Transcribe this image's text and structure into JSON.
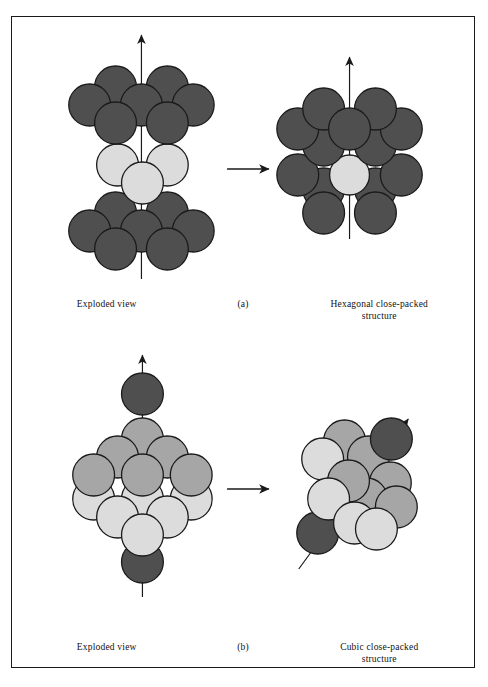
{
  "figure": {
    "background": "#ffffff",
    "border_color": "#1a1a1a"
  },
  "colors": {
    "dark_sphere": "#4f4f4f",
    "medium_sphere": "#a6a6a6",
    "light_sphere": "#dcdcdc",
    "outline": "#1a1a1a",
    "arrow": "#1a1a1a"
  },
  "panels": [
    {
      "id": "a",
      "label": "(a)",
      "left_caption": "Exploded view",
      "right_caption_line1": "Hexagonal close-packed",
      "right_caption_line2": "structure",
      "arrow_name": "transform-arrow-hcp",
      "axis_name": "c-axis-arrow",
      "exploded_layers": [
        {
          "name": "top-layer-A",
          "color_key": "dark_sphere",
          "count": 7,
          "pattern": "hexagonal"
        },
        {
          "name": "middle-layer-B",
          "color_key": "light_sphere",
          "count": 3,
          "pattern": "triangular"
        },
        {
          "name": "bottom-layer-A",
          "color_key": "dark_sphere",
          "count": 7,
          "pattern": "hexagonal"
        }
      ],
      "assembled": {
        "name": "hcp-cluster",
        "stacking": "ABA"
      }
    },
    {
      "id": "b",
      "label": "(b)",
      "left_caption": "Exploded view",
      "right_caption_line1": "Cubic close-packed",
      "right_caption_line2": "structure",
      "arrow_name": "transform-arrow-ccp",
      "axis_name": "body-diagonal-arrow",
      "exploded_layers": [
        {
          "name": "apex-sphere-top",
          "color_key": "dark_sphere",
          "count": 1,
          "pattern": "single"
        },
        {
          "name": "layer-B-medium",
          "color_key": "medium_sphere",
          "count": 6,
          "pattern": "triangle-up"
        },
        {
          "name": "layer-C-light",
          "color_key": "light_sphere",
          "count": 6,
          "pattern": "triangle-down"
        },
        {
          "name": "apex-sphere-bottom",
          "color_key": "dark_sphere",
          "count": 1,
          "pattern": "single"
        }
      ],
      "assembled": {
        "name": "ccp-cluster",
        "stacking": "ABC"
      }
    }
  ]
}
